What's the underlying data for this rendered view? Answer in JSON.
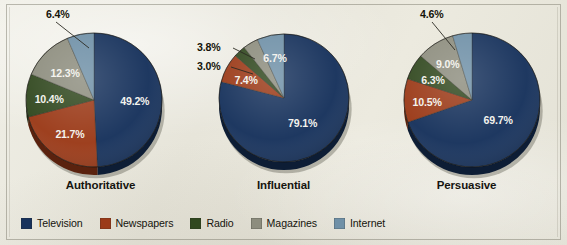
{
  "figure": {
    "background_color": "#e9e7dd",
    "border_color": "#7e7c6e"
  },
  "legend": {
    "position": "bottom-left",
    "items": [
      {
        "label": "Television",
        "color": "#17325c"
      },
      {
        "label": "Newspapers",
        "color": "#9b3a18"
      },
      {
        "label": "Radio",
        "color": "#31481f"
      },
      {
        "label": "Magazines",
        "color": "#8d8d7e"
      },
      {
        "label": "Internet",
        "color": "#6f90a7"
      }
    ]
  },
  "chart_data": [
    {
      "type": "pie",
      "title": "Authoritative",
      "categories": [
        "Television",
        "Newspapers",
        "Radio",
        "Magazines",
        "Internet"
      ],
      "values": [
        49.2,
        21.7,
        10.4,
        12.3,
        6.4
      ],
      "labels": [
        "49.2%",
        "21.7%",
        "10.4%",
        "12.3%",
        "6.4%"
      ],
      "colors": [
        "#17325c",
        "#9b3a18",
        "#31481f",
        "#8d8d7e",
        "#6f90a7"
      ],
      "label_placement": [
        "inside",
        "inside",
        "inside",
        "inside",
        "outside"
      ],
      "start_angle_deg": 0,
      "direction": "clockwise"
    },
    {
      "type": "pie",
      "title": "Influential",
      "categories": [
        "Television",
        "Newspapers",
        "Radio",
        "Magazines",
        "Internet"
      ],
      "values": [
        79.1,
        7.4,
        3.0,
        3.8,
        6.7
      ],
      "labels": [
        "79.1%",
        "7.4%",
        "3.0%",
        "3.8%",
        "6.7%"
      ],
      "colors": [
        "#17325c",
        "#9b3a18",
        "#31481f",
        "#8d8d7e",
        "#6f90a7"
      ],
      "label_placement": [
        "inside",
        "inside",
        "outside",
        "outside",
        "inside"
      ],
      "start_angle_deg": 0,
      "direction": "clockwise"
    },
    {
      "type": "pie",
      "title": "Persuasive",
      "categories": [
        "Television",
        "Newspapers",
        "Radio",
        "Magazines",
        "Internet"
      ],
      "values": [
        69.7,
        10.5,
        6.3,
        9.0,
        4.6
      ],
      "labels": [
        "69.7%",
        "10.5%",
        "6.3%",
        "9.0%",
        "4.6%"
      ],
      "colors": [
        "#17325c",
        "#9b3a18",
        "#31481f",
        "#8d8d7e",
        "#6f90a7"
      ],
      "label_placement": [
        "inside",
        "inside",
        "inside",
        "inside",
        "outside"
      ],
      "start_angle_deg": 0,
      "direction": "clockwise"
    }
  ]
}
